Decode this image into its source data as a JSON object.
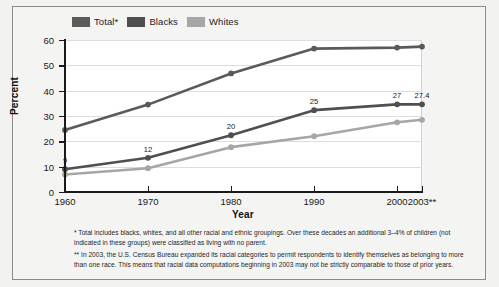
{
  "chart_data": {
    "type": "line",
    "title": "",
    "xlabel": "Year",
    "ylabel": "Percent",
    "categories": [
      "1960",
      "1970",
      "1980",
      "1990",
      "2000",
      "2003**"
    ],
    "x": [
      1960,
      1970,
      1980,
      1990,
      2000,
      2003
    ],
    "xlim": [
      1960,
      2003
    ],
    "ylim": [
      0,
      60
    ],
    "yticks": [
      "0",
      "10",
      "20",
      "30",
      "40",
      "50",
      "60"
    ],
    "grid": true,
    "legend_position": "top-left",
    "series": [
      {
        "name": "Total*",
        "color": "#5a5a5a",
        "values": [
          24.5,
          34.5,
          46.8,
          56.6,
          57.0,
          57.4
        ],
        "point_labels": [
          "",
          "",
          "",
          "",
          "",
          ""
        ]
      },
      {
        "name": "Blacks",
        "color": "#4f4f4f",
        "values": [
          9.0,
          13.5,
          22.4,
          32.3,
          34.6,
          34.6
        ],
        "point_labels": [
          "9",
          "12",
          "20",
          "25",
          "27",
          "27.4"
        ]
      },
      {
        "name": "Whites",
        "color": "#a6a6a6",
        "values": [
          6.9,
          9.4,
          17.7,
          22.0,
          27.5,
          28.5
        ],
        "point_labels": [
          "",
          "",
          "",
          "",
          "",
          ""
        ]
      }
    ]
  },
  "legend": {
    "items": [
      {
        "label": "Total*",
        "color": "#5a5a5a"
      },
      {
        "label": "Blacks",
        "color": "#4f4f4f"
      },
      {
        "label": "Whites",
        "color": "#a6a6a6"
      }
    ]
  },
  "axes": {
    "y_title": "Percent",
    "x_title": "Year",
    "y_ticks": [
      "60",
      "50",
      "40",
      "30",
      "20",
      "10",
      "0"
    ],
    "x_ticks": [
      "1960",
      "1970",
      "1980",
      "1990",
      "2000",
      "2003**"
    ]
  },
  "footnotes": {
    "note1": "* Total includes blacks, whites, and all other racial and ethnic groupings. Over these decades an additional 3–4% of children (not indicated in these groups) were classified as living with no parent.",
    "note2": "** In 2003, the U.S. Census Bureau expanded its racial categories to permit respondents to identify themselves as belonging to more than one race.  This means that racial data computations beginning in 2003 may not be strictly comparable to those of prior years."
  },
  "colors": {
    "background": "#f2f2f1",
    "plot_background": "#ffffff",
    "grid": "#dddddd",
    "axis": "#1a1a1a",
    "total": "#5a5a5a",
    "blacks": "#4f4f4f",
    "whites": "#a6a6a6"
  }
}
